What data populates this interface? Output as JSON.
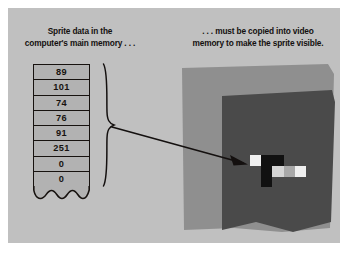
{
  "figure": {
    "background_color": "#ffffff",
    "panel_color": "#c0c0c0"
  },
  "captions": {
    "left": {
      "name": "sprite-data-caption",
      "line1": "Sprite data in the",
      "line2": "computer's main memory . . ."
    },
    "right": {
      "name": "video-memory-caption",
      "line1": ". . . must be copied into video",
      "line2": "memory to make the sprite visible."
    }
  },
  "memory_table": {
    "label": "main-memory-bytes",
    "cell_background": "#b2b2b2",
    "border_color": "#17120f",
    "values": [
      "89",
      "101",
      "74",
      "76",
      "91",
      "251",
      "0",
      "0"
    ]
  },
  "connector": {
    "brace_label": "curly-brace",
    "arrow_label": "copy-arrow",
    "stroke_color": "#14100f"
  },
  "video_memory": {
    "outer_color": "#8f8f8f",
    "screen_color": "#4a4a4a",
    "label": "video-memory-screen"
  },
  "sprite": {
    "label": "sprite-pixels",
    "palette": {
      "white": "#efefef",
      "light": "#d4d4d4",
      "mid": "#a8a8a8",
      "black": "#111111"
    },
    "cols": 5,
    "rows": 3,
    "pixels": [
      {
        "col": 0,
        "row": 0,
        "color": "#efefef"
      },
      {
        "col": 1,
        "row": 0,
        "color": "#111111"
      },
      {
        "col": 2,
        "row": 0,
        "color": "#111111"
      },
      {
        "col": 1,
        "row": 1,
        "color": "#111111"
      },
      {
        "col": 2,
        "row": 1,
        "color": "#d4d4d4"
      },
      {
        "col": 3,
        "row": 1,
        "color": "#a8a8a8"
      },
      {
        "col": 4,
        "row": 1,
        "color": "#efefef"
      },
      {
        "col": 1,
        "row": 2,
        "color": "#111111"
      }
    ]
  }
}
